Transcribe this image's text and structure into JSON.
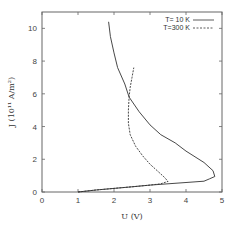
{
  "chart_data": {
    "type": "line",
    "title": "",
    "xlabel": "U (V)",
    "ylabel": "J (10^11 A/m^2)",
    "xlim": [
      0,
      5
    ],
    "ylim": [
      0,
      11
    ],
    "xticks": [
      0,
      1,
      2,
      3,
      4,
      5
    ],
    "yticks": [
      0,
      2,
      4,
      6,
      8,
      10
    ],
    "grid": false,
    "legend_position": "top-right",
    "series": [
      {
        "name": "T= 10 K",
        "style": "solid",
        "x": [
          1.0,
          1.5,
          2.0,
          2.5,
          3.0,
          3.5,
          4.0,
          4.5,
          4.65,
          4.8,
          4.75,
          4.5,
          4.0,
          3.7,
          3.3,
          3.0,
          2.7,
          2.42,
          2.3,
          2.1,
          2.0,
          1.9,
          1.85
        ],
        "y": [
          0.0,
          0.12,
          0.22,
          0.32,
          0.42,
          0.5,
          0.58,
          0.66,
          0.8,
          0.95,
          1.3,
          1.8,
          2.5,
          3.0,
          3.5,
          4.1,
          4.9,
          5.8,
          6.6,
          7.6,
          8.5,
          9.5,
          10.4
        ]
      },
      {
        "name": "T=300 K",
        "style": "dashed",
        "x": [
          1.0,
          1.5,
          2.0,
          2.5,
          3.0,
          3.3,
          3.5,
          3.4,
          3.2,
          3.0,
          2.8,
          2.6,
          2.45,
          2.4,
          2.4,
          2.42,
          2.45,
          2.5,
          2.55
        ],
        "y": [
          0.0,
          0.12,
          0.22,
          0.32,
          0.42,
          0.5,
          0.65,
          0.9,
          1.3,
          1.7,
          2.2,
          2.8,
          3.5,
          4.2,
          5.0,
          5.8,
          6.4,
          7.0,
          7.6
        ]
      }
    ]
  },
  "axes": {
    "xlabel": "U (V)",
    "ylabel": "J (10¹¹ A/m²)",
    "xtick_labels": [
      "0",
      "1",
      "2",
      "3",
      "4",
      "5"
    ],
    "ytick_labels": [
      "0",
      "2",
      "4",
      "6",
      "8",
      "10"
    ]
  },
  "legend": {
    "items": [
      {
        "label": "T= 10 K",
        "style": "solid"
      },
      {
        "label": "T=300 K",
        "style": "dashed"
      }
    ]
  },
  "colors": {
    "axis": "#555555",
    "line": "#333333",
    "text": "#444444"
  }
}
